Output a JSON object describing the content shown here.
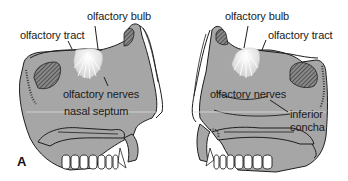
{
  "figure": {
    "panel_label": "A",
    "left_view": {
      "labels": {
        "olfactory_bulb": "olfactory bulb",
        "olfactory_tract": "olfactory tract",
        "olfactory_nerves": "olfactory nerves",
        "nasal_septum": "nasal septum"
      }
    },
    "right_view": {
      "labels": {
        "olfactory_bulb": "olfactory bulb",
        "olfactory_tract": "olfactory tract",
        "olfactory_nerves": "olfactory nerves",
        "inferior_concha_line1": "inferior",
        "inferior_concha_line2": "concha"
      }
    },
    "colors": {
      "tissue_fill": "#a6a6a6",
      "outline": "#1e1e1e",
      "bone_hatch": "#5a5a5a",
      "bulb": "#f4f4f4",
      "teeth": "#ffffff"
    }
  }
}
